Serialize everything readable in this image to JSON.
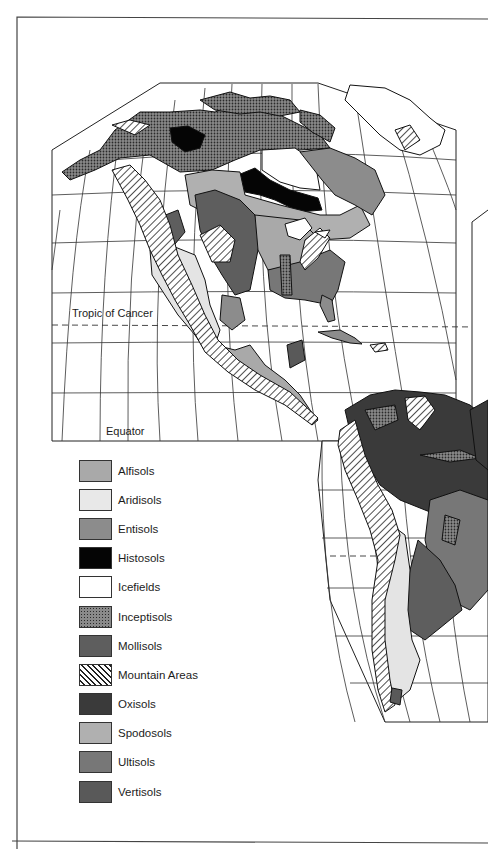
{
  "map": {
    "title": "",
    "region": "North and South America",
    "projection_labels": {
      "tropic_of_cancer": "Tropic of Cancer",
      "equator": "Equator"
    },
    "colors": {
      "alfisols": "#a9a9a9",
      "aridisols": "#e4e4e4",
      "entisols": "#8c8c8c",
      "histosols": "#050505",
      "icefields": "#ffffff",
      "inceptisols": "#6e6e6e",
      "mollisols": "#5e5e5e",
      "mountain_areas": "#ffffff",
      "oxisols": "#3a3a3a",
      "spodosols": "#b0b0b0",
      "ultisols": "#777777",
      "vertisols": "#595959",
      "graticule": "#222222",
      "coastline": "#111111"
    }
  },
  "legend": {
    "items": [
      {
        "label": "Alfisols",
        "key": "alfisols",
        "pattern": "solid"
      },
      {
        "label": "Aridisols",
        "key": "aridisols",
        "pattern": "solid"
      },
      {
        "label": "Entisols",
        "key": "entisols",
        "pattern": "solid"
      },
      {
        "label": "Histosols",
        "key": "histosols",
        "pattern": "solid"
      },
      {
        "label": "Icefields",
        "key": "icefields",
        "pattern": "solid"
      },
      {
        "label": "Inceptisols",
        "key": "inceptisols",
        "pattern": "dots"
      },
      {
        "label": "Mollisols",
        "key": "mollisols",
        "pattern": "solid"
      },
      {
        "label": "Mountain Areas",
        "key": "mountain_areas",
        "pattern": "hatch"
      },
      {
        "label": "Oxisols",
        "key": "oxisols",
        "pattern": "solid"
      },
      {
        "label": "Spodosols",
        "key": "spodosols",
        "pattern": "solid"
      },
      {
        "label": "Ultisols",
        "key": "ultisols",
        "pattern": "solid"
      },
      {
        "label": "Vertisols",
        "key": "vertisols",
        "pattern": "solid"
      }
    ]
  }
}
